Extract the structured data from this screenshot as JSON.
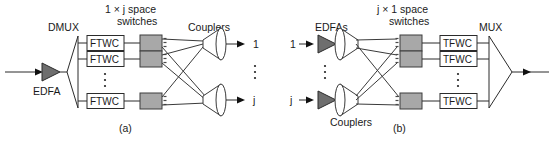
{
  "figure": {
    "caption_a": "(a)",
    "caption_b": "(b)"
  },
  "panel_a": {
    "labels": {
      "dmux": "DMUX",
      "edfa": "EDFA",
      "switches_line1": "1 × j space",
      "switches_line2": "switches",
      "couplers": "Couplers"
    },
    "converters": [
      {
        "label": "FTWC"
      },
      {
        "label": "FTWC"
      },
      {
        "label": "FTWC"
      }
    ],
    "outputs": [
      {
        "label": "1"
      },
      {
        "label": "j"
      }
    ],
    "vertical_ellipsis": "⋮"
  },
  "panel_b": {
    "labels": {
      "edfas": "EDFAs",
      "couplers": "Couplers",
      "mux": "MUX",
      "switches_line1": "j × 1 space",
      "switches_line2": "switches"
    },
    "inputs": [
      {
        "label": "1"
      },
      {
        "label": "j"
      }
    ],
    "converters": [
      {
        "label": "TFWC"
      },
      {
        "label": "TFWC"
      },
      {
        "label": "TFWC"
      }
    ],
    "vertical_ellipsis": "⋮"
  },
  "colors": {
    "line": "#2b2b2b",
    "switch_fill": "#a8a8a8",
    "amplifier_fill": "#6e6e6e",
    "background": "#ffffff",
    "text": "#1a1a1a"
  }
}
